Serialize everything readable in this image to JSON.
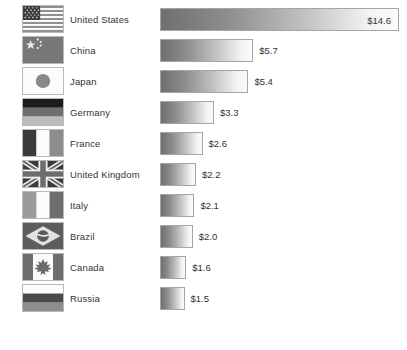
{
  "chart_data": {
    "type": "bar",
    "title": "",
    "subtitle": "",
    "xlabel": "",
    "ylabel": "",
    "orientation": "horizontal",
    "grid": false,
    "legend": "none",
    "value_prefix": "$",
    "xlim": [
      0,
      14.6
    ],
    "categories": [
      "United States",
      "China",
      "Japan",
      "Germany",
      "France",
      "United Kingdom",
      "Italy",
      "Brazil",
      "Canada",
      "Russia"
    ],
    "values": [
      14.6,
      5.7,
      5.4,
      3.3,
      2.6,
      2.2,
      2.1,
      2.0,
      1.6,
      1.5
    ],
    "value_labels": [
      "$14.6",
      "$5.7",
      "$5.4",
      "$3.3",
      "$2.6",
      "$2.2",
      "$2.1",
      "$2.0",
      "$1.6",
      "$1.5"
    ],
    "bar_style": {
      "gradient_from": "#6f6f6f",
      "gradient_to": "#fbfbfb",
      "border": "#a5a5a5"
    }
  },
  "rows": [
    {
      "country": "United States",
      "value_label": "$14.6",
      "value": 14.6,
      "flag_icon": "flag-united-states-icon",
      "label_inside": true
    },
    {
      "country": "China",
      "value_label": "$5.7",
      "value": 5.7,
      "flag_icon": "flag-china-icon",
      "label_inside": false
    },
    {
      "country": "Japan",
      "value_label": "$5.4",
      "value": 5.4,
      "flag_icon": "flag-japan-icon",
      "label_inside": false
    },
    {
      "country": "Germany",
      "value_label": "$3.3",
      "value": 3.3,
      "flag_icon": "flag-germany-icon",
      "label_inside": false
    },
    {
      "country": "France",
      "value_label": "$2.6",
      "value": 2.6,
      "flag_icon": "flag-france-icon",
      "label_inside": false
    },
    {
      "country": "United Kingdom",
      "value_label": "$2.2",
      "value": 2.2,
      "flag_icon": "flag-united-kingdom-icon",
      "label_inside": false
    },
    {
      "country": "Italy",
      "value_label": "$2.1",
      "value": 2.1,
      "flag_icon": "flag-italy-icon",
      "label_inside": false
    },
    {
      "country": "Brazil",
      "value_label": "$2.0",
      "value": 2.0,
      "flag_icon": "flag-brazil-icon",
      "label_inside": false
    },
    {
      "country": "Canada",
      "value_label": "$1.6",
      "value": 1.6,
      "flag_icon": "flag-canada-icon",
      "label_inside": false
    },
    {
      "country": "Russia",
      "value_label": "$1.5",
      "value": 1.5,
      "flag_icon": "flag-russia-icon",
      "label_inside": false
    }
  ]
}
